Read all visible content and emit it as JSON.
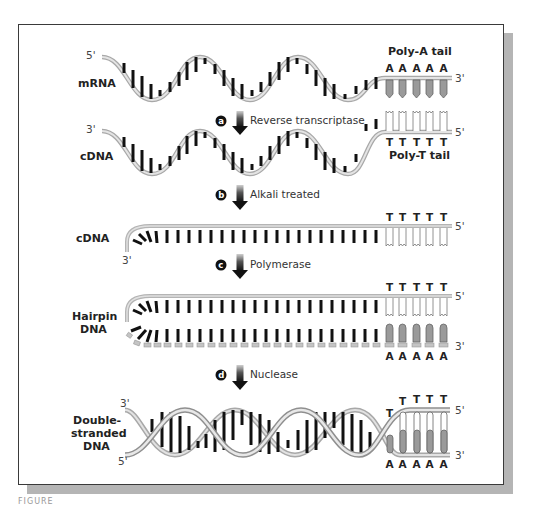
{
  "figure": {
    "caption_fragment": "FIGURE",
    "rows": [
      {
        "id": "mrna",
        "label": "mRNA",
        "left_end": "5'",
        "right_end": "3'",
        "tail_label": "Poly-A tail",
        "tail_bases": [
          "A",
          "A",
          "A",
          "A",
          "A"
        ]
      },
      {
        "id": "cdna1",
        "label": "cDNA",
        "left_end": "3'",
        "right_end": "5'",
        "tail_label": "Poly-T tail",
        "tail_bases": [
          "T",
          "T",
          "T",
          "T",
          "T"
        ]
      },
      {
        "id": "cdna2",
        "label": "cDNA",
        "left_end": "3'",
        "right_end": "5'",
        "tail_bases": [
          "T",
          "T",
          "T",
          "T",
          "T"
        ]
      },
      {
        "id": "hairpin",
        "label_line1": "Hairpin",
        "label_line2": "DNA",
        "right_end_top": "5'",
        "right_end_bottom": "3'",
        "top_bases": [
          "T",
          "T",
          "T",
          "T",
          "T"
        ],
        "bottom_bases": [
          "A",
          "A",
          "A",
          "A",
          "A"
        ]
      },
      {
        "id": "dsdna",
        "label_line1": "Double-",
        "label_line2": "stranded",
        "label_line3": "DNA",
        "left_end_top": "3'",
        "left_end_bottom": "5'",
        "right_end_top": "5'",
        "right_end_bottom": "3'",
        "top_bases": [
          "T",
          "T",
          "T",
          "T",
          "T"
        ],
        "bottom_bases": [
          "A",
          "A",
          "A",
          "A",
          "A"
        ]
      }
    ],
    "steps": [
      {
        "letter": "a",
        "label": "Reverse transcriptase"
      },
      {
        "letter": "b",
        "label": "Alkali treated"
      },
      {
        "letter": "c",
        "label": "Polymerase"
      },
      {
        "letter": "d",
        "label": "Nuclease"
      }
    ],
    "colors": {
      "backbone": "#c8c8c8",
      "backbone_dark": "#9a9a9a",
      "rung": "#111111",
      "tail_fill": "#9a9a9a",
      "frame_shadow": "#b5b5b5"
    }
  }
}
